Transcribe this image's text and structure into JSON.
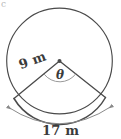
{
  "figure": {
    "kind": "circle-sector-diagram",
    "background_color": "#ffffff",
    "stroke_color": "#4a4a4a",
    "text_color": "#3b3b3b",
    "labels": {
      "radius": "9 m",
      "angle": "θ",
      "arc_length": "17 m"
    },
    "geometry": {
      "circle": {
        "cx": 59.5,
        "cy": 61,
        "r": 53
      },
      "center_dot": {
        "cx": 59.5,
        "cy": 61,
        "r": 1.8
      },
      "radius_left_endpoint": {
        "x": 14,
        "y": 98
      },
      "radius_right_endpoint": {
        "x": 105,
        "y": 97
      },
      "angle_arc": {
        "rx": 19,
        "ry": 19
      },
      "dimension_arc": {
        "start": {
          "x": 7,
          "y": 108
        },
        "end": {
          "x": 113,
          "y": 107
        },
        "sagitta_y": 131
      }
    },
    "corner_artifact": "c"
  }
}
